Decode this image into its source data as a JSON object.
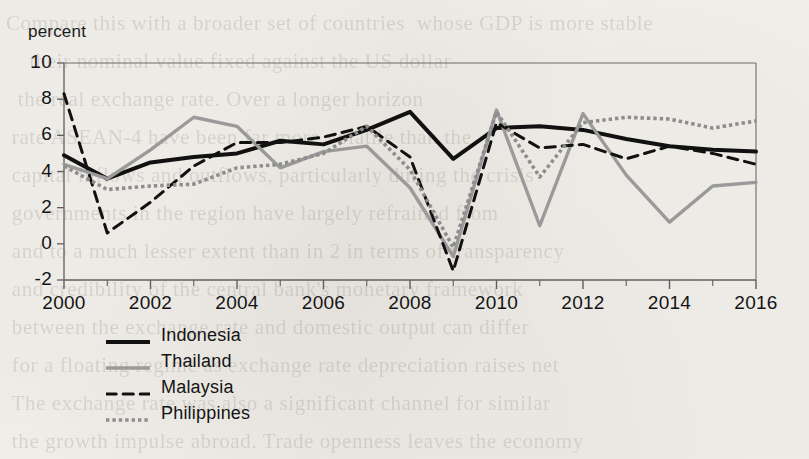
{
  "figure": {
    "y_axis_title": "percent",
    "background_note": "scanned-book-page"
  },
  "bleed_text": "Compare this with a broader set of countries  whose GDP is more stable\n    their nominal value fixed against the US dollar\n  the real exchange rate. Over a longer horizon\n rate ASEAN-4 have been far more volatile than the\n capital inflows and outflows, particularly during the crisis\n governments in the region have largely refrained from\n and to a much lesser extent than in 2 in terms of transparency\n and credibility of the central bank's monetary framework\n between the exchange rate and domestic output can differ\n for a floating regime as exchange rate depreciation raises net\n The exchange rate was also a significant channel for similar\n the growth impulse abroad. Trade openness leaves the economy\n that. There are a number of",
  "legend": {
    "position": "bottom-left",
    "items": [
      {
        "label": "Indonesia",
        "style": "solid",
        "color": "#111111",
        "width": 4.0
      },
      {
        "label": "Thailand",
        "style": "solid",
        "color": "#9a9a9a",
        "width": 3.4
      },
      {
        "label": "Malaysia",
        "style": "dashed",
        "color": "#111111",
        "width": 3.0
      },
      {
        "label": "Philippines",
        "style": "dotted",
        "color": "#8d8d8d",
        "width": 3.6
      }
    ]
  },
  "chart_data": {
    "type": "line",
    "title": "",
    "xlabel": "",
    "ylabel": "percent",
    "xlim": [
      2000,
      2016
    ],
    "ylim": [
      -2,
      10
    ],
    "ytick_values": [
      10,
      8,
      6,
      4,
      2,
      0,
      -2
    ],
    "ytick_labels": [
      "10",
      "8",
      "6",
      "4",
      "2",
      "0",
      "-2"
    ],
    "xtick_values": [
      2000,
      2002,
      2004,
      2006,
      2008,
      2010,
      2012,
      2014,
      2016
    ],
    "xtick_labels": [
      "2000",
      "2002",
      "2004",
      "2006",
      "2008",
      "2010",
      "2012",
      "2014",
      "2016"
    ],
    "x_minor_tick_step": 1,
    "grid": false,
    "x": [
      2000,
      2001,
      2002,
      2003,
      2004,
      2005,
      2006,
      2007,
      2008,
      2009,
      2010,
      2011,
      2012,
      2013,
      2014,
      2015,
      2016
    ],
    "series": [
      {
        "name": "Indonesia",
        "style": "solid",
        "color": "#111111",
        "width": 4.0,
        "values": [
          4.9,
          3.6,
          4.5,
          4.8,
          5.0,
          5.7,
          5.5,
          6.3,
          7.3,
          4.7,
          6.4,
          6.5,
          6.3,
          5.8,
          5.4,
          5.2,
          5.1
        ]
      },
      {
        "name": "Thailand",
        "style": "solid",
        "color": "#9a9a9a",
        "width": 3.4,
        "values": [
          4.4,
          3.6,
          5.2,
          7.0,
          6.5,
          4.2,
          5.1,
          5.4,
          3.1,
          -0.7,
          7.4,
          1.0,
          7.2,
          3.8,
          1.2,
          3.2,
          3.4
        ]
      },
      {
        "name": "Malaysia",
        "style": "dashed",
        "color": "#111111",
        "width": 3.0,
        "values": [
          8.3,
          0.6,
          2.3,
          4.3,
          5.6,
          5.6,
          5.9,
          6.5,
          4.8,
          -1.5,
          6.7,
          5.3,
          5.5,
          4.7,
          5.4,
          5.0,
          4.4
        ]
      },
      {
        "name": "Philippines",
        "style": "dotted",
        "color": "#8d8d8d",
        "width": 3.6,
        "values": [
          4.3,
          3.0,
          3.2,
          3.3,
          4.2,
          4.4,
          5.0,
          6.5,
          4.1,
          -0.2,
          7.3,
          3.7,
          6.7,
          7.0,
          6.9,
          6.4,
          6.8
        ]
      }
    ]
  }
}
